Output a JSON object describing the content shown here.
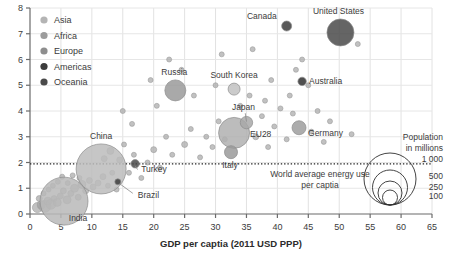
{
  "chart_data": {
    "type": "scatter",
    "title": "",
    "xlabel": "GDP per captia (2011 USD PPP)",
    "ylabel": "",
    "xlim": [
      0,
      65
    ],
    "ylim": [
      0,
      8
    ],
    "xticks": [
      "0",
      "5",
      "10",
      "15",
      "20",
      "25",
      "30",
      "35",
      "40",
      "45",
      "50",
      "55",
      "60",
      "65"
    ],
    "yticks": [
      "0",
      "1",
      "2",
      "3",
      "4",
      "5",
      "6",
      "7",
      "8"
    ],
    "grid": true,
    "legend_position": "top-left",
    "bubble_size_meaning": "Population in millions",
    "reference_line": {
      "y": 1.95,
      "label_line1": "World average energy use",
      "label_line2": "per captia"
    },
    "legend": [
      {
        "name": "Asia",
        "color": "#b4b4b4"
      },
      {
        "name": "Africa",
        "color": "#9c9c9c"
      },
      {
        "name": "Europe",
        "color": "#8e8e8e"
      },
      {
        "name": "Americas",
        "color": "#3c3c3c"
      },
      {
        "name": "Oceania",
        "color": "#4a4a4a"
      }
    ],
    "size_legend": {
      "title_line1": "Population",
      "title_line2": "in millions",
      "values": [
        "1 000",
        "500",
        "250",
        "100"
      ]
    },
    "points": [
      {
        "name": "United States",
        "x": 50.2,
        "y": 7.05,
        "pop": 320,
        "group": "Americas",
        "color": "#4a4a4a",
        "r": 13.5,
        "label_dx": -2,
        "label_dy": -18,
        "label_anchor": "middle"
      },
      {
        "name": "Canada",
        "x": 41.5,
        "y": 7.3,
        "pop": 36,
        "group": "Americas",
        "color": "#3c3c3c",
        "r": 5.0,
        "label_dx": -10,
        "label_dy": -7,
        "label_anchor": "end"
      },
      {
        "name": "Australia",
        "x": 44.0,
        "y": 5.15,
        "pop": 24,
        "group": "Oceania",
        "color": "#303030",
        "r": 4.2,
        "label_dx": 7,
        "label_dy": 2.5,
        "label_anchor": "start"
      },
      {
        "name": "South Korea",
        "x": 33.0,
        "y": 4.85,
        "pop": 51,
        "group": "Asia",
        "color": "#c2c2c2",
        "r": 6.0,
        "label_dx": 0,
        "label_dy": -11,
        "label_anchor": "middle"
      },
      {
        "name": "Russia",
        "x": 23.5,
        "y": 4.8,
        "pop": 144,
        "group": "Europe",
        "color": "#9a9a9a",
        "r": 10.5,
        "label_dx": -1,
        "label_dy": -15,
        "label_anchor": "middle"
      },
      {
        "name": "Japan",
        "x": 35.0,
        "y": 3.55,
        "pop": 127,
        "group": "Asia",
        "color": "#a8a8a8",
        "r": 6.2,
        "label_dx": -3,
        "label_dy": -13,
        "label_anchor": "middle"
      },
      {
        "name": "Germany",
        "x": 43.5,
        "y": 3.35,
        "pop": 82,
        "group": "Europe",
        "color": "#9e9e9e",
        "r": 7.0,
        "label_dx": 9,
        "label_dy": 8,
        "label_anchor": "start"
      },
      {
        "name": "EU28",
        "x": 33.0,
        "y": 3.15,
        "pop": 508,
        "group": "Europe",
        "color": "#b0b0b0",
        "r": 15.5,
        "label_dx": 16,
        "label_dy": 4,
        "label_anchor": "start"
      },
      {
        "name": "Italy",
        "x": 32.5,
        "y": 2.4,
        "pop": 60,
        "group": "Europe",
        "color": "#9a9a9a",
        "r": 6.5,
        "label_dx": -1,
        "label_dy": 16,
        "label_anchor": "middle"
      },
      {
        "name": "China",
        "x": 11.5,
        "y": 1.75,
        "pop": 1380,
        "group": "Asia",
        "color": "#bcbcbc",
        "r": 25.0,
        "label_dx": 0,
        "label_dy": -30,
        "label_anchor": "middle"
      },
      {
        "name": "Turkey",
        "x": 17.0,
        "y": 1.95,
        "pop": 79,
        "group": "Asia",
        "color": "#4a4a4a",
        "r": 4.2,
        "label_dx": 6,
        "label_dy": 8,
        "label_anchor": "start"
      },
      {
        "name": "India",
        "x": 5.5,
        "y": 0.5,
        "pop": 1320,
        "group": "Asia",
        "color": "#b8b8b8",
        "r": 24.0,
        "label_dx": 14,
        "label_dy": 20,
        "label_anchor": "middle"
      },
      {
        "name": "Brazil",
        "x": 14.2,
        "y": 1.25,
        "pop": 208,
        "group": "Americas",
        "color": "#3c3c3c",
        "r": 3.0,
        "label_dx": 20,
        "label_dy": 16,
        "label_anchor": "start"
      }
    ]
  }
}
